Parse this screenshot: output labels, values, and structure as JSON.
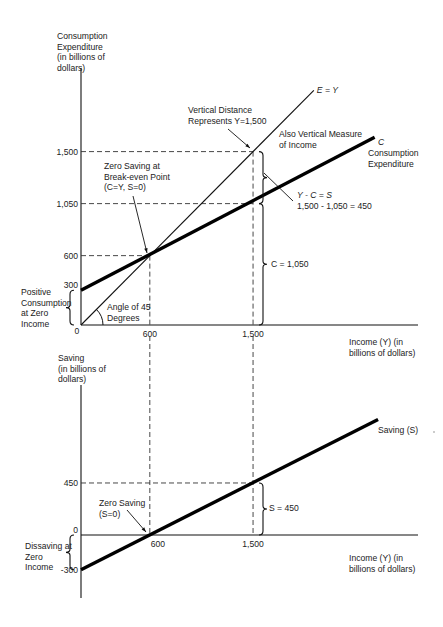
{
  "chart_data": [
    {
      "type": "line",
      "title": "",
      "ylabel": [
        "Consumption",
        "Expenditure",
        "(in billions of",
        "dollars)"
      ],
      "xlabel": [
        "Income (Y) (in",
        "billions of dollars)"
      ],
      "xlim": [
        0,
        2950
      ],
      "ylim": [
        0,
        2270
      ],
      "yticks": [
        {
          "value": 1500,
          "label": "1,500"
        },
        {
          "value": 1050,
          "label": "1,050"
        },
        {
          "value": 600,
          "label": "600"
        },
        {
          "value": 300,
          "label": "300"
        },
        {
          "value": 0,
          "label": "0"
        }
      ],
      "xticks": [
        {
          "value": 600,
          "label": "600"
        },
        {
          "value": 1500,
          "label": "1,500"
        }
      ],
      "series": [
        {
          "name": "E = Y",
          "label": "E = Y",
          "x": [
            0,
            2030
          ],
          "y": [
            0,
            2030
          ],
          "style": "thin"
        },
        {
          "name": "C",
          "label": "C",
          "sublabel": [
            "Consumption",
            "Expenditure"
          ],
          "x": [
            0,
            2560
          ],
          "y": [
            300,
            1624
          ],
          "style": "thick"
        }
      ],
      "guides": [
        {
          "from": [
            0,
            1500
          ],
          "to": [
            1500,
            1500
          ]
        },
        {
          "from": [
            0,
            1050
          ],
          "to": [
            1500,
            1050
          ]
        },
        {
          "from": [
            0,
            600
          ],
          "to": [
            600,
            600
          ]
        },
        {
          "from": [
            600,
            600
          ],
          "to": [
            600,
            0
          ]
        },
        {
          "from": [
            1500,
            1500
          ],
          "to": [
            1500,
            0
          ]
        }
      ],
      "annotations": {
        "vertical_distance": [
          "Vertical Distance",
          "Represents Y=1,500"
        ],
        "also_vertical": [
          "Also Vertical Measure",
          "of Income"
        ],
        "zero_saving": [
          "Zero Saving at",
          "Break-even Point",
          "(C=Y, S=0)"
        ],
        "y_minus_c": "Y - C = S",
        "equation": "1,500 - 1,050 = 450",
        "c_value": "C = 1,050",
        "positive_consumption": [
          "Positive",
          "Consumption",
          "at Zero",
          "Income"
        ],
        "angle": [
          "Angle of 45",
          "Degrees"
        ]
      }
    },
    {
      "type": "line",
      "title": "",
      "ylabel": [
        "Saving",
        "(in billions of",
        "dollars)"
      ],
      "xlabel": [
        "Income (Y) (in",
        "billions of dollars)"
      ],
      "xlim": [
        0,
        2950
      ],
      "ylim": [
        -550,
        1300
      ],
      "yticks": [
        {
          "value": 450,
          "label": "450"
        },
        {
          "value": 0,
          "label": "0"
        },
        {
          "value": -300,
          "label": "-300"
        }
      ],
      "xticks": [
        {
          "value": 600,
          "label": "600"
        },
        {
          "value": 1500,
          "label": "1,500"
        }
      ],
      "series": [
        {
          "name": "Saving (S)",
          "label": "Saving (S)",
          "x": [
            0,
            2590
          ],
          "y": [
            -300,
            1000
          ],
          "style": "thick"
        }
      ],
      "guides": [
        {
          "from": [
            0,
            450
          ],
          "to": [
            1500,
            450
          ]
        },
        {
          "from": [
            600,
            1300
          ],
          "to": [
            600,
            0
          ]
        },
        {
          "from": [
            1500,
            1300
          ],
          "to": [
            1500,
            0
          ]
        }
      ],
      "annotations": {
        "zero_saving": [
          "Zero Saving",
          "(S=0)"
        ],
        "s_value": "S = 450",
        "dissaving": [
          "Dissaving at",
          "Zero",
          "Income"
        ]
      }
    }
  ]
}
